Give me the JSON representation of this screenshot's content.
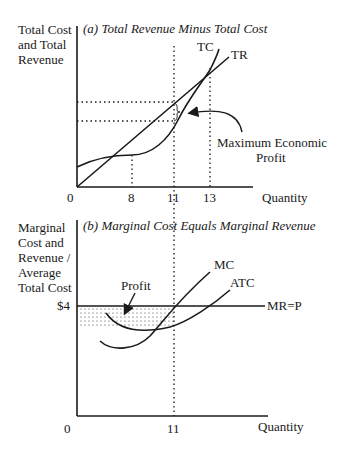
{
  "panel_a": {
    "title": "(a) Total Revenue Minus Total Cost",
    "ylabel": [
      "Total Cost",
      "and Total",
      "Revenue"
    ],
    "xlabel": "Quantity",
    "ticks": [
      "0",
      "8",
      "11",
      "13"
    ],
    "curves": {
      "tc": "TC",
      "tr": "TR"
    },
    "annotation": [
      "Maximum Economic",
      "Profit"
    ]
  },
  "panel_b": {
    "title": "(b) Marginal Cost Equals Marginal Revenue",
    "ylabel": [
      "Marginal",
      "Cost and",
      "Revenue /",
      "Average",
      "Total Cost"
    ],
    "xlabel": "Quantity",
    "ticks": [
      "0",
      "11"
    ],
    "price_label": "$4",
    "curves": {
      "mc": "MC",
      "atc": "ATC",
      "mr": "MR=P"
    },
    "annotation": "Profit"
  },
  "colors": {
    "ink": "#1a1a1a",
    "background": "#ffffff"
  }
}
